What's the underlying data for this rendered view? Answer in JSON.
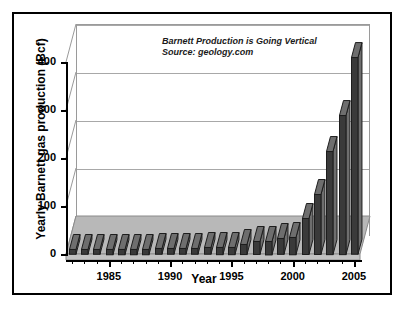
{
  "figure": {
    "background": "#ffffff",
    "frame_color": "#000000"
  },
  "annotation": {
    "line1": "Barnett Production is Going Vertical",
    "line2": "Source: geology.com"
  },
  "axes": {
    "y_title": "Yearly Barnett gas production (Bcf)",
    "x_title": "Year",
    "y_ticks": [
      "400",
      "300",
      "200",
      "100",
      "0"
    ],
    "x_ticks": [
      "1985",
      "1990",
      "1995",
      "2000",
      "2005"
    ]
  },
  "colors": {
    "bar_front": "#3a3a3a",
    "bar_side": "#6e6e6e",
    "bar_edge": "#1d1d1d",
    "floor": "#b8b8b8",
    "floor_edge": "#8a8a8a",
    "gridline": "#a8a8a8",
    "wall_edge": "#9a9a9a",
    "axis": "#000000"
  },
  "chart_data": {
    "type": "bar",
    "title": "",
    "annotation": "Barnett Production is Going Vertical",
    "source": "Source: geology.com",
    "xlabel": "Year",
    "ylabel": "Yearly Barnett gas production (Bcf)",
    "ylim": [
      0,
      440
    ],
    "yticks": [
      0,
      100,
      200,
      300,
      400
    ],
    "xlim": [
      1982,
      2005
    ],
    "xticks": [
      1985,
      1990,
      1995,
      2000,
      2005
    ],
    "grid": true,
    "legend": false,
    "three_d": true,
    "categories": [
      1982,
      1983,
      1984,
      1985,
      1986,
      1987,
      1988,
      1989,
      1990,
      1991,
      1992,
      1993,
      1994,
      1995,
      1996,
      1997,
      1998,
      1999,
      2000,
      2001,
      2002,
      2003,
      2004,
      2005
    ],
    "values": [
      10,
      10,
      10,
      11,
      11,
      11,
      11,
      12,
      12,
      12,
      12,
      14,
      15,
      15,
      21,
      27,
      28,
      33,
      36,
      75,
      125,
      215,
      290,
      410
    ]
  }
}
